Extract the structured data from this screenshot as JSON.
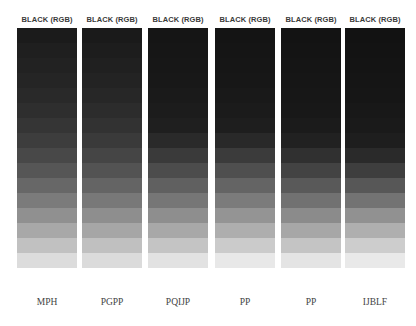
{
  "columns": [
    {
      "header": "BLACK (RGB)",
      "label": "MPH",
      "bands": [
        "#1b1b1b",
        "#1f1f1f",
        "#222222",
        "#252525",
        "#292929",
        "#2e2e2e",
        "#353535",
        "#3d3d3d",
        "#484848",
        "#565656",
        "#676767",
        "#7b7b7b",
        "#909090",
        "#a8a8a8",
        "#c1c1c1",
        "#dcdcdc"
      ]
    },
    {
      "header": "BLACK (RGB)",
      "label": "PGPP",
      "bands": [
        "#1a1a1a",
        "#1d1d1d",
        "#202020",
        "#232323",
        "#272727",
        "#2c2c2c",
        "#323232",
        "#3a3a3a",
        "#454545",
        "#535353",
        "#646464",
        "#787878",
        "#8e8e8e",
        "#a6a6a6",
        "#c0c0c0",
        "#dbdbdb"
      ]
    },
    {
      "header": "BLACK (RGB)",
      "label": "PQIJP",
      "bands": [
        "#151515",
        "#161616",
        "#171717",
        "#181818",
        "#1a1a1a",
        "#1c1c1c",
        "#1f1f1f",
        "#2a2a2a",
        "#3a3a3a",
        "#4c4c4c",
        "#606060",
        "#767676",
        "#8e8e8e",
        "#a8a8a8",
        "#c4c4c4",
        "#e2e2e2"
      ]
    },
    {
      "header": "BLACK (RGB)",
      "label": "PP",
      "bands": [
        "#141414",
        "#151515",
        "#161616",
        "#171717",
        "#191919",
        "#1b1b1b",
        "#1e1e1e",
        "#292929",
        "#3b3b3b",
        "#4f4f4f",
        "#646464",
        "#7b7b7b",
        "#949494",
        "#aeaeae",
        "#cbcbcb",
        "#e8e8e8"
      ]
    },
    {
      "header": "BLACK (RGB)",
      "label": "PP",
      "bands": [
        "#131313",
        "#141414",
        "#151515",
        "#161616",
        "#171717",
        "#181818",
        "#1b1b1b",
        "#212121",
        "#303030",
        "#434343",
        "#595959",
        "#717171",
        "#8b8b8b",
        "#a7a7a7",
        "#c4c4c4",
        "#e4e4e4"
      ]
    },
    {
      "header": "BLACK (RGB)",
      "label": "IJBLF",
      "bands": [
        "#121212",
        "#131313",
        "#141414",
        "#151515",
        "#161616",
        "#181818",
        "#1a1a1a",
        "#1e1e1e",
        "#2a2a2a",
        "#3e3e3e",
        "#575757",
        "#737373",
        "#919191",
        "#afafaf",
        "#cdcdcd",
        "#e9e9e9"
      ]
    }
  ]
}
